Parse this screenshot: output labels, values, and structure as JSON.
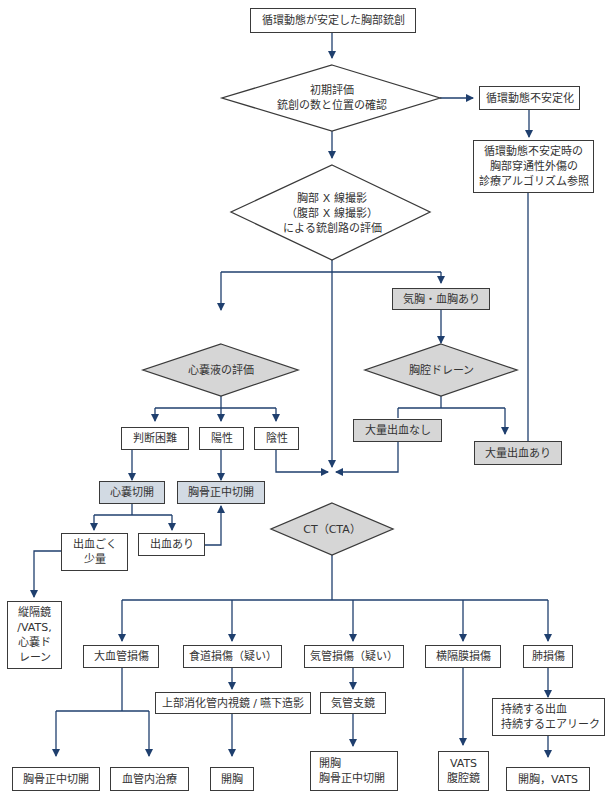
{
  "diagram": {
    "type": "flowchart",
    "line_color": "#1f3f6e",
    "border_color": "#3a3a3a",
    "fill_gray": "#d6d6d6",
    "fill_blue": "#d2dae3",
    "nodes": {
      "start": "循環動態が安定した胸部銃創",
      "initial_eval": "初期評価\n銃創の数と位置の確認",
      "unstable": "循環動態不安定化",
      "unstable_ref": "循環動態不安定時の\n胸部穿通性外傷の\n診療アルゴリズム参照",
      "xray": "胸部 X 線撮影\n（腹部 X 線撮影）\nによる銃創路の評価",
      "pneumo": "気胸・血胸あり",
      "pericardial_eval": "心嚢液の評価",
      "chest_drain": "胸腔ドレーン",
      "difficult": "判断困難",
      "positive": "陽性",
      "negative": "陰性",
      "no_massive_bleed": "大量出血なし",
      "massive_bleed": "大量出血あり",
      "pericardiotomy": "心嚢切開",
      "sternotomy_upper": "胸骨正中切開",
      "ct": "CT（CTA）",
      "minimal_bleed": "出血ごく\n少量",
      "bleed_present": "出血あり",
      "mediastinoscopy": "縦隔鏡\n/VATS,\n心嚢ド\nレーン",
      "great_vessel": "大血管損傷",
      "esophageal": "食道損傷（疑い）",
      "tracheal": "気管損傷（疑い）",
      "diaphragm": "横隔膜損傷",
      "lung": "肺損傷",
      "endoscopy": "上部消化管内視鏡 / 嚥下造影",
      "bronchoscopy": "気管支鏡",
      "persistent": "持続する出血\n持続するエアリーク",
      "sternotomy_lower": "胸骨正中切開",
      "endovascular": "血管内治療",
      "thoracotomy": "開胸",
      "thoracotomy_sternotomy": "開胸\n胸骨正中切開",
      "vats_laparoscopy": "VATS\n腹腔鏡",
      "thoracotomy_vats": "開胸，VATS"
    }
  }
}
